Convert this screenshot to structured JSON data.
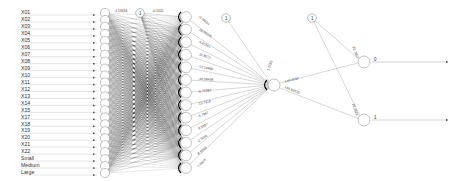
{
  "diagram": {
    "type": "neural-network",
    "inputs": [
      "X01",
      "X02",
      "X03",
      "X04",
      "X05",
      "X06",
      "X07",
      "X08",
      "X09",
      "X10",
      "X11",
      "X12",
      "X13",
      "X14",
      "X15",
      "X17",
      "X18",
      "X19",
      "X20",
      "X21",
      "X22",
      "Small",
      "Medium",
      "Large"
    ],
    "hidden1_count": 24,
    "hidden2_count": 13,
    "hidden3_count": 1,
    "outputs": [
      "0",
      "1"
    ],
    "bias_label": "1",
    "weights_hidden2_to_hidden3": [
      "-3.78634",
      "-10.66225",
      "-4.41551",
      "-11.8572",
      "-12.14466",
      "-10.56459",
      "-6.74287",
      "-10.7418",
      "-3.7967",
      "-9.5997",
      "-2.7026",
      "-8.6063",
      "-7.9928"
    ],
    "bias_hidden3": "1.1782",
    "weights_hidden3_to_output": [
      "-149.4034",
      "148.93516"
    ],
    "bias_output": [
      "-25.7857",
      "26.2823"
    ],
    "weight_top_h1": "-1.13416",
    "weight_top_h2": "-0.1325"
  }
}
